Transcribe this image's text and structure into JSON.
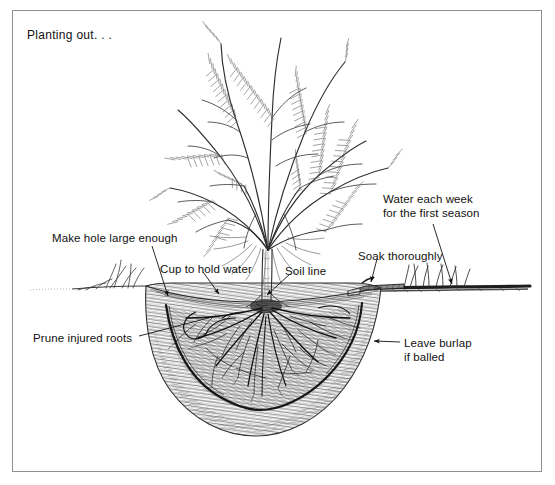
{
  "figure": {
    "domain": "diagram",
    "medium": "pen-and-ink line drawing",
    "title": "Planting out. . .",
    "background_color": "#ffffff",
    "ink_color": "#111111",
    "frame": {
      "visible": true,
      "border_color": "#8f8f8f",
      "x": 12,
      "y": 10,
      "width": 530,
      "height": 462
    }
  },
  "labels": [
    {
      "id": "make-hole-large-enough",
      "text": "Make hole large enough",
      "x": 52,
      "y": 231,
      "lines": 1,
      "leader": {
        "from": [
          152,
          246
        ],
        "to": [
          168,
          298
        ],
        "arrow": true
      }
    },
    {
      "id": "cup-to-hold-water",
      "text": "Cup to hold water",
      "x": 160,
      "y": 262,
      "lines": 1,
      "leader": {
        "from": [
          203,
          272
        ],
        "to": [
          219,
          296
        ],
        "arrow": true
      }
    },
    {
      "id": "soil-line",
      "text": "Soil line",
      "x": 285,
      "y": 264,
      "lines": 1,
      "leader": {
        "from": [
          290,
          274
        ],
        "to": [
          266,
          296
        ],
        "arrow": true
      }
    },
    {
      "id": "prune-injured-roots",
      "text": "Prune injured roots",
      "x": 33,
      "y": 331,
      "lines": 1,
      "leader": {
        "from": [
          139,
          336
        ],
        "to": [
          215,
          316
        ],
        "arrow": false
      }
    },
    {
      "id": "water-each-week",
      "text": "Water each week\nfor the first season",
      "x": 383,
      "y": 192,
      "lines": 2,
      "leader": {
        "from": [
          432,
          222
        ],
        "to": [
          452,
          287
        ],
        "arrow": true
      }
    },
    {
      "id": "soak-thoroughly",
      "text": "Soak thoroughly",
      "x": 358,
      "y": 249,
      "lines": 1,
      "leader": {
        "from": [
          378,
          259
        ],
        "to": [
          372,
          285
        ],
        "arrow": true
      }
    },
    {
      "id": "leave-burlap-if-balled",
      "text": "Leave burlap\nif balled",
      "x": 404,
      "y": 336,
      "lines": 2,
      "leader": {
        "from": [
          400,
          343
        ],
        "to": [
          372,
          341
        ],
        "arrow": true
      }
    }
  ],
  "scene_parts": [
    {
      "id": "shrub-foliage",
      "description": "feathery needled shrub crown with arching branches"
    },
    {
      "id": "trunk",
      "description": "single upright trunk entering the soil"
    },
    {
      "id": "soil-line-surface",
      "description": "horizontal ground surface line with grass tufts"
    },
    {
      "id": "planting-hole",
      "description": "wide saucer-shaped excavated hole with hatched cut soil walls"
    },
    {
      "id": "root-ball",
      "description": "rounded root ball with spreading branched roots"
    },
    {
      "id": "burlap-edge",
      "description": "dark outline of burlap wrap around the root ball"
    },
    {
      "id": "water-basin-cup",
      "description": "raised rim of soil forming a cup to hold water"
    },
    {
      "id": "hose-nozzle",
      "description": "garden hose end lying at the right edge of the hole"
    },
    {
      "id": "grass-left",
      "description": "tuft of grass on the undisturbed ground at left"
    },
    {
      "id": "grass-right",
      "description": "tufts of grass along the ground at right"
    }
  ]
}
